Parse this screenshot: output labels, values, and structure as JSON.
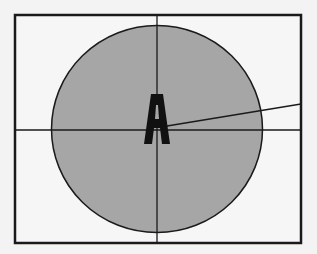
{
  "diagram": {
    "label": "A",
    "colors": {
      "background": "#f3f3f3",
      "frame_fill": "#f6f6f6",
      "frame_stroke": "#1a1a1a",
      "circle_fill": "#a6a6a6",
      "circle_stroke": "#1a1a1a",
      "line_stroke": "#1a1a1a",
      "label_color": "#111111"
    }
  }
}
